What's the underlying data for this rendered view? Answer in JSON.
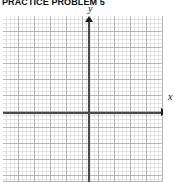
{
  "worksheet": {
    "title": "PRACTICE PROBLEM 5"
  },
  "graph": {
    "axis_x_label": "x",
    "axis_y_label": "y"
  },
  "chart_data": {
    "type": "scatter",
    "title": "PRACTICE PROBLEM 5",
    "xlabel": "x",
    "ylabel": "y",
    "series": [],
    "x": [],
    "values": [],
    "xlim": [
      -5.5,
      4.5
    ],
    "ylim": [
      -5.25,
      5.0
    ],
    "grid": true,
    "minor_grid": true,
    "major_gridline_spacing": 1,
    "minor_gridlines_per_major": 4,
    "legend": "none",
    "annotations": []
  }
}
